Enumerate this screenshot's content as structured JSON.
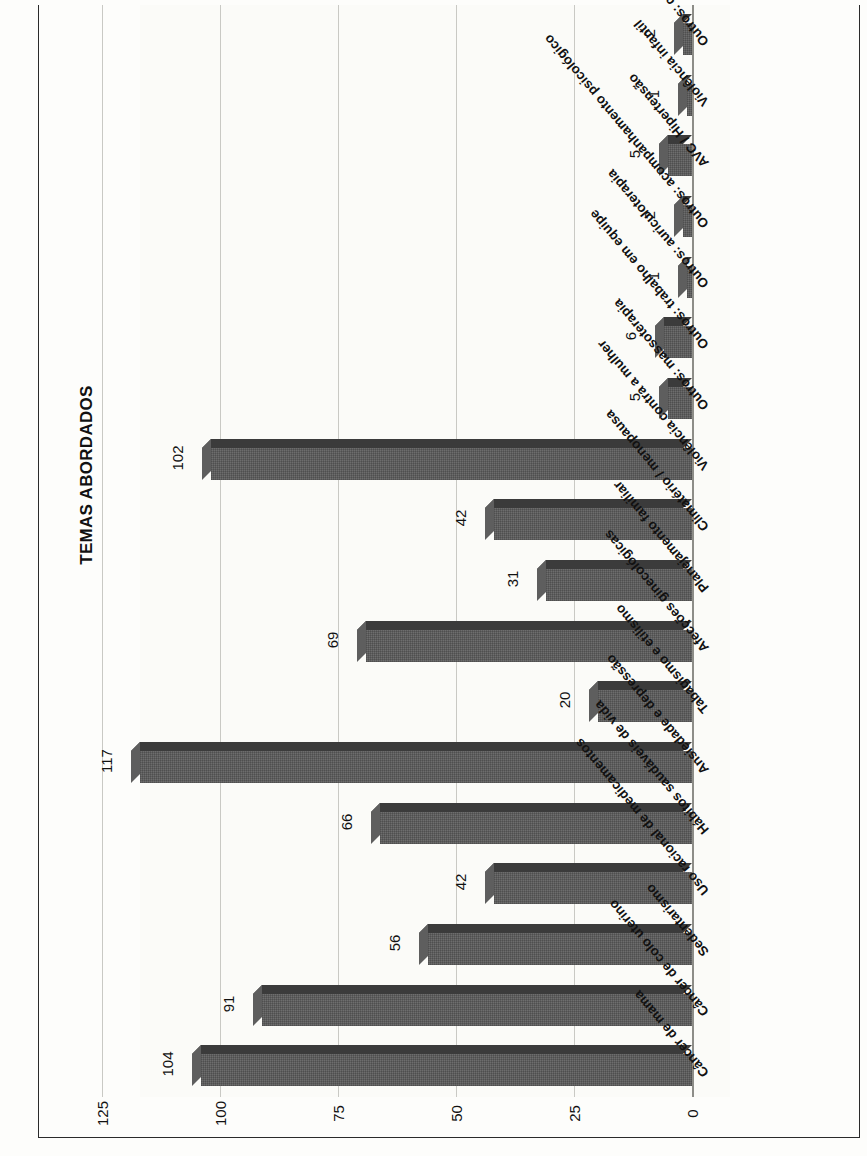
{
  "figure": {
    "title": "Gráfico 2 – Distribuição dos temas abordados durante período de 2019",
    "subtitle": "TEMAS ABORDADOS"
  },
  "chart_data": {
    "type": "bar",
    "orientation": "horizontal",
    "title": "TEMAS ABORDADOS",
    "xlabel": "",
    "ylabel": "",
    "xlim": [
      0,
      125
    ],
    "grid": true,
    "legend": false,
    "tick_labels": [
      "0",
      "25",
      "50",
      "75",
      "100",
      "125"
    ],
    "ticks": [
      0,
      25,
      50,
      75,
      100,
      125
    ],
    "categories": [
      "Câncer de mama",
      "Câncer de colo uterino",
      "Sedentarismo",
      "Uso racional de medicamentos",
      "Hábitos saudáveis de vida",
      "Ansiedade e depressão",
      "Tabagismo e etilismo",
      "Afecções ginecológicas",
      "Planejamento familiar",
      "Climatério / menopausa",
      "Violência contra a mulher",
      "Outros: massoterapia",
      "Outros: trabalho em equipe",
      "Outros: auriculoterapia",
      "Outros: acompanhamento psicológico",
      "AVC / Hipertensão",
      "Violência infantil",
      "Outros: câncer de tireoide"
    ],
    "values": [
      104,
      91,
      56,
      42,
      66,
      117,
      20,
      69,
      31,
      42,
      102,
      5,
      6,
      1,
      2,
      5,
      1,
      2
    ]
  },
  "colors": {
    "bar_face": "#9c9c9c",
    "bar_top": "#3b3b3b",
    "bar_side": "#5e5e5e",
    "grid": "#c9c9c4",
    "frame": "#2a2a2a",
    "text": "#111111",
    "background": "#fdfdfb"
  }
}
